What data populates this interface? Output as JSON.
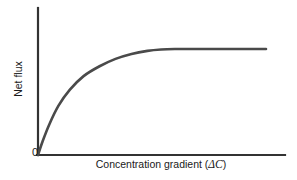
{
  "figure": {
    "background_color": "#ffffff",
    "axis_color": "#333333",
    "curve_color": "#4a4a4a",
    "text_color": "#1a1a1a",
    "origin_label": "0",
    "y_axis_title": "Net flux",
    "x_axis_title_main": "Concentration gradient (",
    "x_axis_title_symbol": "ΔC",
    "x_axis_title_close": ")",
    "x_axis_title_full": "Concentration gradient (ΔC)"
  },
  "chart_data": {
    "type": "line",
    "title": "",
    "subtitle": "",
    "xlabel": "Concentration gradient (ΔC)",
    "ylabel": "Net flux",
    "xlim": [
      0,
      100
    ],
    "ylim": [
      0,
      100
    ],
    "grid": false,
    "legend": null,
    "axis_tick_labels": {
      "x": [],
      "y": [],
      "origin": "0"
    },
    "annotations": [],
    "series": [
      {
        "name": "Net flux vs concentration gradient",
        "shape": "saturating",
        "plateau_value": 86,
        "x": [
          0,
          2,
          5,
          9,
          14,
          20,
          27,
          34,
          41,
          48,
          54,
          60,
          66,
          72,
          78,
          84,
          90,
          95,
          100
        ],
        "y": [
          0,
          11,
          25,
          40,
          53,
          64,
          72,
          78,
          82,
          84.5,
          85.6,
          86,
          86,
          86,
          86,
          86,
          86,
          86,
          86
        ]
      }
    ]
  }
}
